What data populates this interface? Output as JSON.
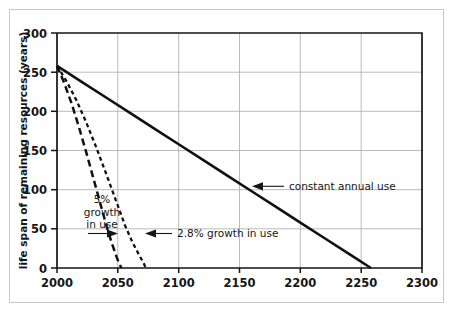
{
  "chart_data": {
    "type": "line",
    "title": "",
    "xlabel": "",
    "ylabel": "life span of remaining resources (years)",
    "xlim": [
      2000,
      2300
    ],
    "ylim": [
      0,
      300
    ],
    "xticks": [
      2000,
      2050,
      2100,
      2150,
      2200,
      2250,
      2300
    ],
    "yticks": [
      0,
      50,
      100,
      150,
      200,
      250,
      300
    ],
    "xtick_labels": [
      "2000",
      "2050",
      "2100",
      "2150",
      "2200",
      "2250",
      "2300"
    ],
    "ytick_labels": [
      "0",
      "50",
      "100",
      "150",
      "200",
      "250",
      "300"
    ],
    "grid": true,
    "legend_position": "inline-annotations",
    "series": [
      {
        "name": "constant annual use",
        "style": "solid",
        "x": [
          2000,
          2020,
          2040,
          2060,
          2080,
          2100,
          2120,
          2140,
          2160,
          2180,
          2200,
          2220,
          2240,
          2258
        ],
        "values": [
          258,
          238,
          218,
          198,
          178,
          158,
          138,
          118,
          98,
          78,
          58,
          38,
          18,
          0
        ]
      },
      {
        "name": "2.8% growth in use",
        "style": "dashed-short",
        "x": [
          2000,
          2008,
          2016,
          2024,
          2032,
          2040,
          2048,
          2056,
          2062,
          2068,
          2071,
          2073
        ],
        "values": [
          258,
          238,
          214,
          186,
          155,
          122,
          88,
          54,
          33,
          15,
          7,
          0
        ]
      },
      {
        "name": "5% growth in use",
        "style": "dashed-long",
        "x": [
          2000,
          2006,
          2012,
          2018,
          2024,
          2030,
          2036,
          2041,
          2045,
          2049,
          2051,
          2053
        ],
        "values": [
          258,
          236,
          210,
          180,
          148,
          114,
          80,
          52,
          32,
          14,
          6,
          0
        ]
      }
    ],
    "annotations": [
      {
        "id": "constant-annual-use",
        "text": "constant annual use",
        "arrow": "left",
        "anchor_value": [
          2158,
          104
        ]
      },
      {
        "id": "growth-2-8",
        "text": "2.8% growth in use",
        "arrow": "left",
        "anchor_value": [
          2072,
          44
        ]
      },
      {
        "id": "growth-5",
        "text_lines": [
          "5%",
          "growth",
          "in use"
        ],
        "text": "5% growth in use",
        "arrow": "right",
        "anchor_value": [
          2051,
          44
        ]
      }
    ],
    "colors": {
      "line": "#111111",
      "grid": "#b3b3b3",
      "axis": "#151515",
      "background": "#ffffff",
      "frame": "#c9c9c9"
    }
  }
}
